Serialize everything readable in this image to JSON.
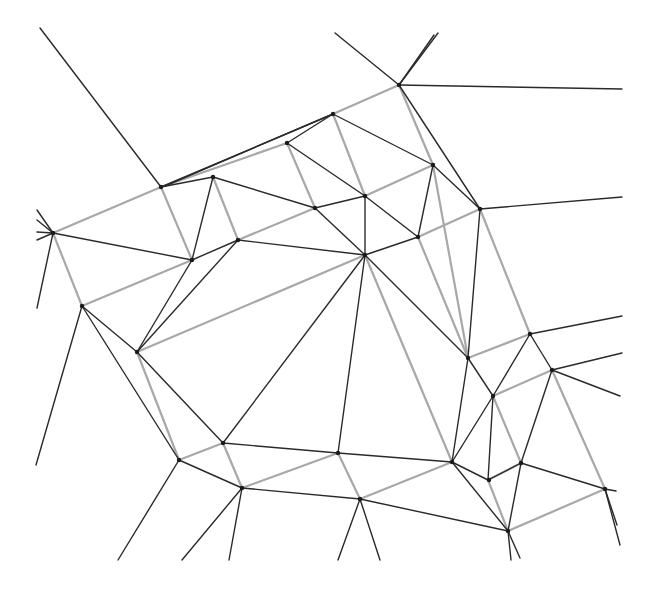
{
  "diagram": {
    "type": "voronoi-delaunay-overlay",
    "width": 650,
    "height": 590,
    "colors": {
      "black_edge": "#2a2a2a",
      "gray_edge": "#a8a8a8",
      "vertex": "#1a1a1a",
      "background": "#ffffff"
    },
    "vertices": [
      [
        53,
        233
      ],
      [
        82,
        306
      ],
      [
        137,
        352
      ],
      [
        161,
        187
      ],
      [
        192,
        260
      ],
      [
        213,
        177
      ],
      [
        238,
        240
      ],
      [
        287,
        143
      ],
      [
        315,
        208
      ],
      [
        333,
        114
      ],
      [
        365,
        196
      ],
      [
        365,
        255
      ],
      [
        399,
        85
      ],
      [
        418,
        237
      ],
      [
        433,
        165
      ],
      [
        480,
        209
      ],
      [
        468,
        358
      ],
      [
        493,
        396
      ],
      [
        530,
        334
      ],
      [
        552,
        370
      ],
      [
        223,
        443
      ],
      [
        179,
        460
      ],
      [
        242,
        488
      ],
      [
        338,
        453
      ],
      [
        360,
        499
      ],
      [
        452,
        462
      ],
      [
        489,
        480
      ],
      [
        521,
        463
      ],
      [
        508,
        531
      ],
      [
        605,
        489
      ]
    ],
    "black_edges": [
      [
        [
          40,
          28
        ],
        [
          161,
          187
        ]
      ],
      [
        [
          161,
          187
        ],
        [
          333,
          114
        ]
      ],
      [
        [
          165,
          186
        ],
        [
          333,
          114
        ]
      ],
      [
        [
          161,
          187
        ],
        [
          213,
          177
        ]
      ],
      [
        [
          213,
          177
        ],
        [
          315,
          208
        ]
      ],
      [
        [
          213,
          177
        ],
        [
          192,
          260
        ]
      ],
      [
        [
          53,
          233
        ],
        [
          192,
          260
        ]
      ],
      [
        [
          192,
          260
        ],
        [
          238,
          240
        ]
      ],
      [
        [
          238,
          240
        ],
        [
          365,
          255
        ]
      ],
      [
        [
          287,
          143
        ],
        [
          333,
          114
        ]
      ],
      [
        [
          287,
          143
        ],
        [
          365,
          196
        ]
      ],
      [
        [
          315,
          208
        ],
        [
          365,
          196
        ]
      ],
      [
        [
          315,
          208
        ],
        [
          365,
          255
        ]
      ],
      [
        [
          365,
          196
        ],
        [
          365,
          255
        ]
      ],
      [
        [
          365,
          196
        ],
        [
          418,
          237
        ]
      ],
      [
        [
          333,
          114
        ],
        [
          433,
          165
        ]
      ],
      [
        [
          433,
          165
        ],
        [
          418,
          237
        ]
      ],
      [
        [
          433,
          165
        ],
        [
          480,
          209
        ]
      ],
      [
        [
          418,
          237
        ],
        [
          365,
          255
        ]
      ],
      [
        [
          335,
          33
        ],
        [
          399,
          85
        ]
      ],
      [
        [
          399,
          85
        ],
        [
          434,
          35
        ]
      ],
      [
        [
          399,
          85
        ],
        [
          438,
          33
        ]
      ],
      [
        [
          399,
          85
        ],
        [
          622,
          89
        ]
      ],
      [
        [
          399,
          85
        ],
        [
          480,
          209
        ]
      ],
      [
        [
          480,
          209
        ],
        [
          622,
          197
        ]
      ],
      [
        [
          480,
          209
        ],
        [
          468,
          358
        ]
      ],
      [
        [
          365,
          255
        ],
        [
          468,
          358
        ]
      ],
      [
        [
          468,
          358
        ],
        [
          493,
          396
        ]
      ],
      [
        [
          493,
          396
        ],
        [
          530,
          334
        ]
      ],
      [
        [
          530,
          334
        ],
        [
          552,
          370
        ]
      ],
      [
        [
          530,
          334
        ],
        [
          622,
          316
        ]
      ],
      [
        [
          552,
          370
        ],
        [
          622,
          353
        ]
      ],
      [
        [
          552,
          370
        ],
        [
          620,
          396
        ]
      ],
      [
        [
          552,
          370
        ],
        [
          521,
          463
        ]
      ],
      [
        [
          493,
          396
        ],
        [
          488,
          480
        ]
      ],
      [
        [
          493,
          396
        ],
        [
          452,
          462
        ]
      ],
      [
        [
          468,
          358
        ],
        [
          452,
          462
        ]
      ],
      [
        [
          365,
          255
        ],
        [
          338,
          453
        ]
      ],
      [
        [
          365,
          255
        ],
        [
          223,
          443
        ]
      ],
      [
        [
          192,
          260
        ],
        [
          137,
          352
        ]
      ],
      [
        [
          238,
          240
        ],
        [
          137,
          352
        ]
      ],
      [
        [
          82,
          306
        ],
        [
          137,
          352
        ]
      ],
      [
        [
          82,
          306
        ],
        [
          179,
          460
        ]
      ],
      [
        [
          137,
          352
        ],
        [
          223,
          443
        ]
      ],
      [
        [
          223,
          443
        ],
        [
          338,
          453
        ]
      ],
      [
        [
          338,
          453
        ],
        [
          452,
          462
        ]
      ],
      [
        [
          179,
          460
        ],
        [
          242,
          488
        ]
      ],
      [
        [
          242,
          488
        ],
        [
          360,
          499
        ]
      ],
      [
        [
          360,
          499
        ],
        [
          508,
          531
        ]
      ],
      [
        [
          452,
          462
        ],
        [
          488,
          480
        ]
      ],
      [
        [
          452,
          462
        ],
        [
          508,
          531
        ]
      ],
      [
        [
          521,
          463
        ],
        [
          605,
          489
        ]
      ],
      [
        [
          521,
          463
        ],
        [
          508,
          531
        ]
      ],
      [
        [
          488,
          480
        ],
        [
          521,
          463
        ]
      ],
      [
        [
          605,
          489
        ],
        [
          616,
          491
        ]
      ],
      [
        [
          605,
          489
        ],
        [
          617,
          525
        ]
      ],
      [
        [
          605,
          489
        ],
        [
          620,
          545
        ]
      ],
      [
        [
          508,
          531
        ],
        [
          511,
          560
        ]
      ],
      [
        [
          508,
          531
        ],
        [
          520,
          558
        ]
      ],
      [
        [
          360,
          499
        ],
        [
          338,
          560
        ]
      ],
      [
        [
          360,
          499
        ],
        [
          380,
          560
        ]
      ],
      [
        [
          242,
          488
        ],
        [
          182,
          560
        ]
      ],
      [
        [
          242,
          488
        ],
        [
          229,
          560
        ]
      ],
      [
        [
          179,
          460
        ],
        [
          118,
          560
        ]
      ],
      [
        [
          82,
          306
        ],
        [
          36,
          465
        ]
      ],
      [
        [
          53,
          233
        ],
        [
          37,
          308
        ]
      ],
      [
        [
          53,
          233
        ],
        [
          37,
          210
        ]
      ],
      [
        [
          53,
          233
        ],
        [
          37,
          220
        ]
      ],
      [
        [
          53,
          233
        ],
        [
          37,
          232
        ]
      ],
      [
        [
          53,
          233
        ],
        [
          37,
          240
        ]
      ]
    ],
    "gray_edges": [
      [
        [
          53,
          233
        ],
        [
          161,
          187
        ]
      ],
      [
        [
          161,
          187
        ],
        [
          287,
          143
        ]
      ],
      [
        [
          333,
          114
        ],
        [
          399,
          85
        ]
      ],
      [
        [
          161,
          187
        ],
        [
          192,
          260
        ]
      ],
      [
        [
          213,
          177
        ],
        [
          238,
          240
        ]
      ],
      [
        [
          287,
          143
        ],
        [
          315,
          208
        ]
      ],
      [
        [
          333,
          114
        ],
        [
          365,
          196
        ]
      ],
      [
        [
          399,
          85
        ],
        [
          433,
          165
        ]
      ],
      [
        [
          53,
          233
        ],
        [
          82,
          306
        ]
      ],
      [
        [
          82,
          306
        ],
        [
          192,
          260
        ]
      ],
      [
        [
          238,
          240
        ],
        [
          315,
          208
        ]
      ],
      [
        [
          365,
          196
        ],
        [
          433,
          165
        ]
      ],
      [
        [
          137,
          352
        ],
        [
          365,
          255
        ]
      ],
      [
        [
          418,
          237
        ],
        [
          480,
          209
        ]
      ],
      [
        [
          433,
          165
        ],
        [
          468,
          358
        ]
      ],
      [
        [
          480,
          209
        ],
        [
          530,
          334
        ]
      ],
      [
        [
          418,
          237
        ],
        [
          468,
          358
        ]
      ],
      [
        [
          365,
          255
        ],
        [
          452,
          462
        ]
      ],
      [
        [
          137,
          352
        ],
        [
          179,
          460
        ]
      ],
      [
        [
          179,
          460
        ],
        [
          223,
          443
        ]
      ],
      [
        [
          223,
          443
        ],
        [
          242,
          488
        ]
      ],
      [
        [
          242,
          488
        ],
        [
          338,
          453
        ]
      ],
      [
        [
          338,
          453
        ],
        [
          360,
          499
        ]
      ],
      [
        [
          360,
          499
        ],
        [
          452,
          462
        ]
      ],
      [
        [
          468,
          358
        ],
        [
          530,
          334
        ]
      ],
      [
        [
          493,
          396
        ],
        [
          552,
          370
        ]
      ],
      [
        [
          493,
          396
        ],
        [
          521,
          463
        ]
      ],
      [
        [
          488,
          480
        ],
        [
          521,
          463
        ]
      ],
      [
        [
          488,
          480
        ],
        [
          508,
          531
        ]
      ],
      [
        [
          508,
          531
        ],
        [
          605,
          489
        ]
      ],
      [
        [
          552,
          370
        ],
        [
          605,
          489
        ]
      ]
    ]
  }
}
